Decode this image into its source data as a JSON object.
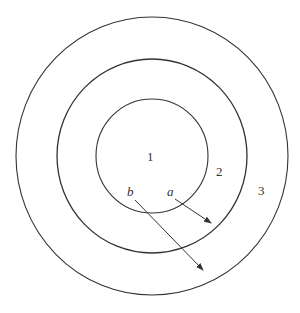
{
  "diagram": {
    "type": "concentric-circles",
    "stroke_color": "#333333",
    "regions": [
      {
        "label": "1",
        "name": "inner"
      },
      {
        "label": "2",
        "name": "middle"
      },
      {
        "label": "3",
        "name": "outer"
      }
    ],
    "arrows": [
      {
        "label": "a",
        "from_region": "1",
        "to_region": "2"
      },
      {
        "label": "b",
        "from_region": "1",
        "to_region": "3"
      }
    ]
  }
}
